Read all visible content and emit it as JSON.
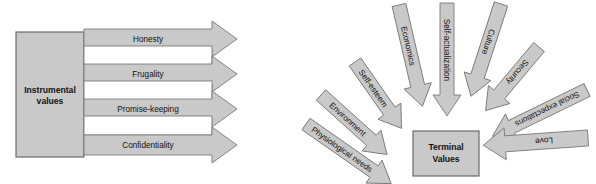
{
  "figure": {
    "title": "",
    "background_color": "#ffffff",
    "arrow_fill": "#c9c9c9",
    "arrow_stroke": "#7a7a7a",
    "box_fill": "#c9c9c9",
    "box_stroke": "#6a6a6a",
    "text_color": "#111111"
  },
  "left_diagram": {
    "source_box": {
      "label_line1": "Instrumental",
      "label_line2": "values"
    },
    "arrows": [
      {
        "label": "Honesty"
      },
      {
        "label": "Frugality"
      },
      {
        "label": "Promise-keeping"
      },
      {
        "label": "Confidentiality"
      }
    ]
  },
  "right_diagram": {
    "target_box": {
      "label_line1": "Terminal",
      "label_line2": "Values"
    },
    "arrows": [
      {
        "label": "Physiological needs"
      },
      {
        "label": "Environment"
      },
      {
        "label": "Self-esteem"
      },
      {
        "label": "Economics"
      },
      {
        "label": "Self-actualization"
      },
      {
        "label": "Culture"
      },
      {
        "label": "Security"
      },
      {
        "label": "Social expectations"
      },
      {
        "label": "Love"
      }
    ]
  }
}
